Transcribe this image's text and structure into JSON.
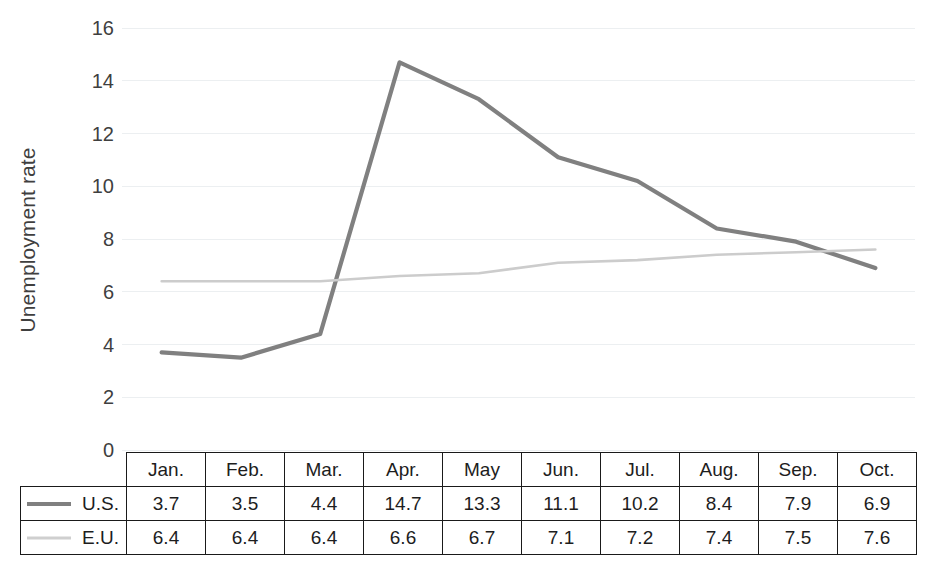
{
  "chart_data": {
    "type": "line",
    "title": "",
    "xlabel": "",
    "ylabel": "Unemployment rate",
    "categories": [
      "Jan.",
      "Feb.",
      "Mar.",
      "Apr.",
      "May",
      "Jun.",
      "Jul.",
      "Aug.",
      "Sep.",
      "Oct."
    ],
    "series": [
      {
        "name": "U.S.",
        "color": "#808080",
        "values": [
          3.7,
          3.5,
          4.4,
          14.7,
          13.3,
          11.1,
          10.2,
          8.4,
          7.9,
          6.9
        ]
      },
      {
        "name": "E.U.",
        "color": "#cccccc",
        "values": [
          6.4,
          6.4,
          6.4,
          6.6,
          6.7,
          7.1,
          7.2,
          7.4,
          7.5,
          7.6
        ]
      }
    ],
    "ylim": [
      0,
      16
    ],
    "ytick_step": 2,
    "yticks": [
      "16",
      "14",
      "12",
      "10",
      "8",
      "6",
      "4",
      "2",
      "0"
    ],
    "grid": true,
    "grid_color": "#eceff1",
    "legend_position": "table-left"
  },
  "table": {
    "corner_label": "",
    "column_headers": [
      "Jan.",
      "Feb.",
      "Mar.",
      "Apr.",
      "May",
      "Jun.",
      "Jul.",
      "Aug.",
      "Sep.",
      "Oct."
    ],
    "rows": [
      {
        "label": "U.S.",
        "swatch": "us-line-swatch",
        "cells": [
          "3.7",
          "3.5",
          "4.4",
          "14.7",
          "13.3",
          "11.1",
          "10.2",
          "8.4",
          "7.9",
          "6.9"
        ]
      },
      {
        "label": "E.U.",
        "swatch": "eu-line-swatch",
        "cells": [
          "6.4",
          "6.4",
          "6.4",
          "6.6",
          "6.7",
          "7.1",
          "7.2",
          "7.4",
          "7.5",
          "7.6"
        ]
      }
    ]
  },
  "axis": {
    "y_title": "Unemployment rate"
  }
}
